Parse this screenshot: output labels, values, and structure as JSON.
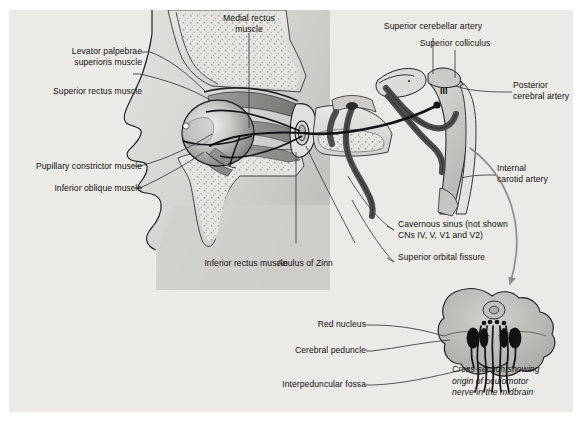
{
  "figure": {
    "background_color": "#eceae6",
    "page_color": "#ffffff",
    "label_color": "#111111",
    "leader_line_color": "#3a3a3a",
    "arrow_color": "#8d8d8d"
  },
  "labels": {
    "levator_palpebrae": "Levator palpebrae\nsuperioris muscle",
    "superior_rectus": "Superior rectus muscle",
    "pupillary_constrictor": "Pupillary constrictor muscle",
    "inferior_oblique": "Inferior oblique muscle",
    "medial_rectus": "Medial rectus\nmuscle",
    "inferior_rectus": "Inferior rectus muscle",
    "anulus_of_zinn": "Anulus of Zinn",
    "superior_cerebellar_artery": "Superior cerebellar artery",
    "superior_colliculus": "Superior colliculus",
    "posterior_cerebral_artery": "Posterior\ncerebral artery",
    "internal_carotid_artery": "Internal\ncarotid artery",
    "cavernous_sinus": "Cavernous sinus (not shown\nCNs IV, V, V1 and V2)",
    "superior_orbital_fissure": "Superior orbital fissure",
    "nerve_iii": "III",
    "red_nucleus": "Red nucleus",
    "cerebral_peduncle": "Cerebral peduncle",
    "interpeduncular_fossa": "Interpeduncular fossa",
    "caption": "Cross-section showing\norigin of oculomotor\nnerve in the midbrain"
  },
  "caption_lines": [
    "Cross-section showing",
    "origin of oculomotor",
    "nerve in the midbrain"
  ],
  "structures": {
    "eye_globe": "eye-globe",
    "face_profile": "face-profile",
    "orbit_bone": "orbital-bone",
    "midbrain_cross_section": "midbrain-cross-section",
    "oculomotor_nerve": "oculomotor-nerve",
    "cavernous_sinus_region": "cavernous-sinus",
    "brainstem": "brainstem"
  }
}
